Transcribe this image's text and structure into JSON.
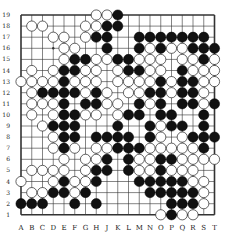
{
  "diagram": {
    "type": "go-board",
    "size": 19,
    "columns": [
      "A",
      "B",
      "C",
      "D",
      "E",
      "F",
      "G",
      "H",
      "J",
      "K",
      "L",
      "M",
      "N",
      "O",
      "P",
      "Q",
      "R",
      "S",
      "T"
    ],
    "rows": [
      19,
      18,
      17,
      16,
      15,
      14,
      13,
      12,
      11,
      10,
      9,
      8,
      7,
      6,
      5,
      4,
      3,
      2,
      1
    ],
    "colors": {
      "black": "#111111",
      "white": "#ffffff",
      "line": "#333333",
      "background": "#ffffff"
    },
    "board": [
      ".......WWB.........",
      ".WW...WWBB.........",
      "...WW.WBB..BBBBBBB.",
      "....WW..B..BWBWWBBB",
      "....WBBWWBBWWW.WWBW",
      ".W.WBBWW.WBBWW.BWWW",
      "WWWWBWWW.WWWWBWBBWW",
      ".WBBBBWBW.WWBBWBBW.",
      ".WWWB.BBWW.BWB.BBWB",
      ".W.WBBWW.WBB.BB..B.",
      "..WBBB...B..BWBB.B.",
      "...WBB.BBBB.BW.WBBB",
      "...WBW.WWBBBWWWWWB.",
      "....W.WWB.BWWBBWWWW",
      ".WWWW.WBB.BWWBWWW..",
      "W..WBWWB...BBBBBWW.",
      ".WWBBWB.....BBBBBW.",
      "BBB..B.B......BBBW.",
      ".............WBWW.."
    ],
    "hoshi": [
      "D16"
    ]
  }
}
